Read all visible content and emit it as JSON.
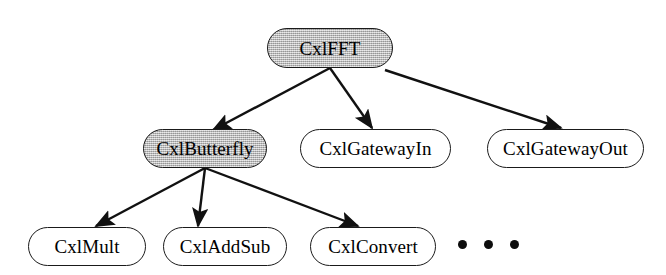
{
  "diagram": {
    "type": "class-hierarchy-tree",
    "stroke_color": "#1a1a1a",
    "shaded_fill": "#b9b9b9",
    "plain_fill": "#ffffff",
    "nodes": [
      {
        "id": "cxlfft",
        "label": "CxlFFT",
        "level": 0,
        "shaded": true,
        "x": 267,
        "y": 28,
        "w": 126,
        "h": 40
      },
      {
        "id": "cxlbutterfly",
        "label": "CxlButterfly",
        "level": 1,
        "shaded": true,
        "x": 143,
        "y": 129,
        "w": 124,
        "h": 39
      },
      {
        "id": "cxlgatewayin",
        "label": "CxlGatewayIn",
        "level": 1,
        "shaded": false,
        "x": 300,
        "y": 129,
        "w": 151,
        "h": 39
      },
      {
        "id": "cxlgatewayout",
        "label": "CxlGatewayOut",
        "level": 1,
        "shaded": false,
        "x": 487,
        "y": 129,
        "w": 157,
        "h": 39
      },
      {
        "id": "cxlmult",
        "label": "CxlMult",
        "level": 2,
        "shaded": false,
        "x": 28,
        "y": 227,
        "w": 118,
        "h": 39
      },
      {
        "id": "cxladdsub",
        "label": "CxlAddSub",
        "level": 2,
        "shaded": false,
        "x": 163,
        "y": 227,
        "w": 124,
        "h": 39
      },
      {
        "id": "cxlconvert",
        "label": "CxlConvert",
        "level": 2,
        "shaded": false,
        "x": 310,
        "y": 227,
        "w": 126,
        "h": 39
      }
    ],
    "edges": [
      {
        "id": "edge-fft-butterfly",
        "from": "cxlfft",
        "to": "cxlbutterfly",
        "x1": 330,
        "y1": 68,
        "x2": 213,
        "y2": 130
      },
      {
        "id": "edge-fft-gatewayin",
        "from": "cxlfft",
        "to": "cxlgatewayin",
        "x1": 330,
        "y1": 68,
        "x2": 372,
        "y2": 128
      },
      {
        "id": "edge-fft-gatewayout",
        "from": "cxlfft",
        "to": "cxlgatewayout",
        "x1": 385,
        "y1": 70,
        "x2": 561,
        "y2": 128
      },
      {
        "id": "edge-butterfly-mult",
        "from": "cxlbutterfly",
        "to": "cxlmult",
        "x1": 205,
        "y1": 168,
        "x2": 96,
        "y2": 226
      },
      {
        "id": "edge-butterfly-addsub",
        "from": "cxlbutterfly",
        "to": "cxladdsub",
        "x1": 205,
        "y1": 168,
        "x2": 198,
        "y2": 226
      },
      {
        "id": "edge-butterfly-convert",
        "from": "cxlbutterfly",
        "to": "cxlconvert",
        "x1": 205,
        "y1": 168,
        "x2": 358,
        "y2": 226
      }
    ],
    "ellipsis": {
      "id": "more-subclasses",
      "label": "• • •",
      "dot_count": 3,
      "x": 458,
      "y": 240
    }
  }
}
